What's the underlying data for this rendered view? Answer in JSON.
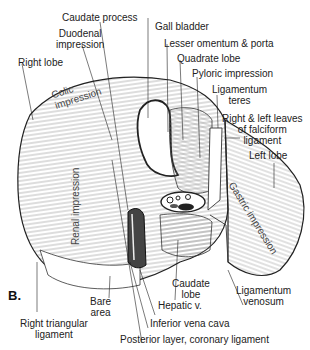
{
  "figure": {
    "panel_label": "B.",
    "colors": {
      "ink": "#222222",
      "background": "#ffffff",
      "hatch": "#555555"
    }
  },
  "labels": {
    "caudate_process": "Caudate process",
    "duodenal_impression_1": "Duodenal",
    "duodenal_impression_2": "impression",
    "right_lobe": "Right lobe",
    "gall_bladder": "Gall bladder",
    "lesser_omentum": "Lesser omentum & porta",
    "quadrate_lobe": "Quadrate lobe",
    "pyloric_impression": "Pyloric impression",
    "ligamentum_teres_1": "Ligamentum",
    "ligamentum_teres_2": "teres",
    "falciform_1": "Right & left leaves",
    "falciform_2": "of falciform",
    "falciform_3": "ligament",
    "left_lobe": "Left lobe",
    "caudate_lobe_1": "Caudate",
    "caudate_lobe_2": "lobe",
    "ligamentum_venosum_1": "Ligamentum",
    "ligamentum_venosum_2": "venosum",
    "hepatic_v": "Hepatic v.",
    "inferior_vena_cava": "Inferior vena cava",
    "posterior_layer": "Posterior layer, coronary ligament",
    "bare_area_1": "Bare",
    "bare_area_2": "area",
    "right_triangular_1": "Right triangular",
    "right_triangular_2": "ligament"
  },
  "impressions": {
    "colic_1": "Colic",
    "colic_2": "impression",
    "renal": "Renal impression",
    "gastric": "Gastric impression"
  }
}
